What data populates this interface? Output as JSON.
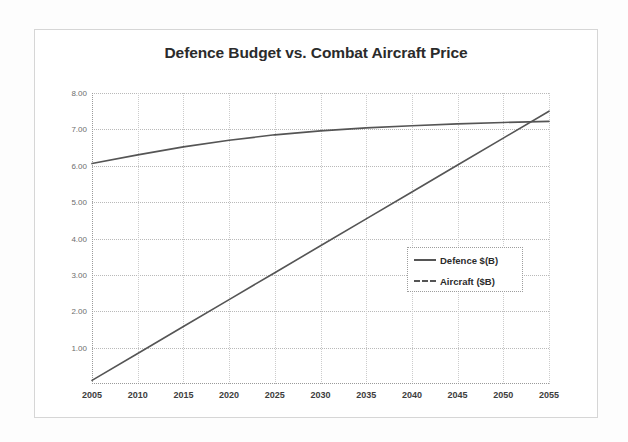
{
  "chart_data": {
    "type": "line",
    "title": "Defence Budget vs. Combat Aircraft Price",
    "xlabel": "",
    "ylabel": "",
    "xlim": [
      2005,
      2055
    ],
    "ylim": [
      0,
      8
    ],
    "grid": true,
    "legend_position": "inside-right",
    "x_ticks": [
      "2005",
      "2010",
      "2015",
      "2020",
      "2025",
      "2030",
      "2035",
      "2040",
      "2045",
      "2050",
      "2055"
    ],
    "y_ticks": [
      "1.00",
      "2.00",
      "3.00",
      "4.00",
      "5.00",
      "6.00",
      "7.00",
      "8.00"
    ],
    "x": [
      2005,
      2010,
      2015,
      2020,
      2025,
      2030,
      2035,
      2040,
      2045,
      2050,
      2055
    ],
    "series": [
      {
        "name": "Defence $(B)",
        "line_style": "solid",
        "color": "#555555",
        "values": [
          0.1,
          0.84,
          1.58,
          2.32,
          3.06,
          3.8,
          4.54,
          5.28,
          6.02,
          6.76,
          7.5
        ]
      },
      {
        "name": "Aircraft ($B)",
        "line_style": "solid",
        "color": "#555555",
        "values": [
          6.06,
          6.3,
          6.52,
          6.7,
          6.85,
          6.96,
          7.04,
          7.1,
          7.15,
          7.19,
          7.22
        ]
      }
    ],
    "legend": [
      "Defence $(B)",
      "Aircraft ($B)"
    ],
    "annotations": []
  },
  "colors": {
    "frame": "#d6d6d6",
    "grid": "#b9b9b9",
    "axis": "#9a9a9a",
    "title_text": "#2b2b2b",
    "tick_text": "#6d6d6d",
    "xtick_text": "#3d3d3d",
    "series_line": "#555555",
    "background": "#ffffff"
  }
}
